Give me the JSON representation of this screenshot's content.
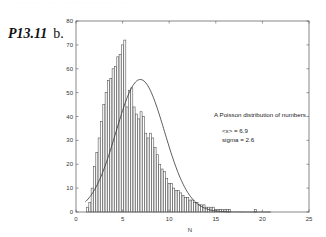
{
  "header": {
    "cut_text": "………… ……………….",
    "problem_number": "P13.11",
    "part": "b."
  },
  "chart_data": {
    "type": "bar",
    "title": "",
    "xlabel": "N",
    "ylabel": "",
    "xlim": [
      0,
      25
    ],
    "ylim": [
      0,
      80
    ],
    "xticks": [
      0,
      5,
      10,
      15,
      20,
      25
    ],
    "yticks": [
      0,
      10,
      20,
      30,
      40,
      50,
      60,
      70,
      80
    ],
    "grid": false,
    "bin_width": 0.25,
    "histogram": {
      "x": [
        1.25,
        1.5,
        1.75,
        2.0,
        2.25,
        2.5,
        2.75,
        3.0,
        3.25,
        3.5,
        3.75,
        4.0,
        4.25,
        4.5,
        4.75,
        5.0,
        5.25,
        5.5,
        5.75,
        6.0,
        6.25,
        6.5,
        6.75,
        7.0,
        7.25,
        7.5,
        7.75,
        8.0,
        8.25,
        8.5,
        8.75,
        9.0,
        9.25,
        9.5,
        9.75,
        10.0,
        10.25,
        10.5,
        10.75,
        11.0,
        11.25,
        11.5,
        11.75,
        12.0,
        12.25,
        12.5,
        12.75,
        13.0,
        13.25,
        13.5,
        13.75,
        14.0,
        14.25,
        14.5,
        14.75,
        15.0,
        15.25,
        15.5,
        15.75,
        16.0,
        16.25,
        16.5,
        19.25
      ],
      "values": [
        2,
        4,
        10,
        19,
        25,
        31,
        38,
        45,
        50,
        55,
        56,
        60,
        61,
        65,
        66,
        70,
        72,
        44,
        51,
        52,
        44,
        41,
        39,
        42,
        40,
        33,
        31,
        33,
        31,
        27,
        24,
        20,
        18,
        17,
        14,
        12,
        12,
        10,
        9,
        9,
        8,
        7,
        6,
        6,
        5,
        5,
        4,
        4,
        3,
        3,
        3,
        2,
        2,
        2,
        2,
        1,
        1,
        1,
        1,
        1,
        1,
        1,
        1
      ]
    },
    "fit_curve": {
      "name": "Gaussian fit",
      "mean": 6.9,
      "sigma": 2.6,
      "peak": 55.5,
      "x": [
        1,
        2,
        3,
        4,
        5,
        6,
        6.9,
        8,
        9,
        10,
        11,
        12,
        13,
        14,
        15,
        16,
        17,
        18,
        19,
        20,
        21
      ],
      "y": [
        3,
        9,
        18,
        30,
        42,
        52,
        55.5,
        53,
        45,
        35,
        25,
        16,
        10,
        5,
        3,
        1.5,
        0.8,
        0.4,
        0.2,
        0.1,
        0
      ]
    },
    "annotations": [
      "A Poisson distribution of numbers",
      "<x> = 6.9",
      "sigma = 2.6"
    ]
  }
}
